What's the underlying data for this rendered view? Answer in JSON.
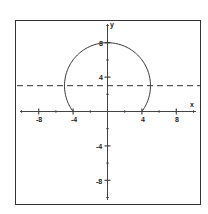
{
  "chart_data": {
    "type": "line",
    "title": "",
    "xlabel": "x",
    "ylabel": "y",
    "xlim": [
      -10,
      10
    ],
    "ylim": [
      -10.5,
      10.5
    ],
    "grid": false,
    "x_ticks": [
      -8,
      -4,
      4,
      8
    ],
    "y_ticks": [
      -8,
      -4,
      4,
      8
    ],
    "minor_tick_step": 2,
    "series": [
      {
        "name": "circle arc",
        "description": "Circle centered at (0,3) radius 5, drawn from (-4,0) over the top to (4,0)",
        "center": [
          0,
          3
        ],
        "radius": 5,
        "points": [
          [
            -4,
            0
          ],
          [
            -5,
            3
          ],
          [
            -4,
            6
          ],
          [
            0,
            8
          ],
          [
            4,
            6
          ],
          [
            5,
            3
          ],
          [
            4,
            0
          ]
        ],
        "style": "solid"
      },
      {
        "name": "horizontal line y = 3",
        "y": 3,
        "style": "dashed"
      }
    ],
    "colors": {
      "curve": "#333333",
      "axes": "#444444",
      "frame": "#333333"
    }
  },
  "labels": {
    "x_axis": "x",
    "y_axis": "y",
    "x_ticks": [
      "-8",
      "-4",
      "4",
      "8"
    ],
    "y_ticks": [
      "8",
      "4",
      "-4",
      "-8"
    ]
  }
}
